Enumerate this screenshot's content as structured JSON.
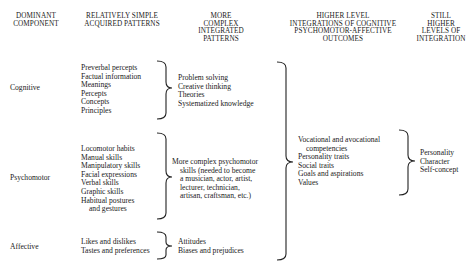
{
  "headers": {
    "col1": [
      "DOMINANT",
      "COMPONENT"
    ],
    "col2": [
      "RELATIVELY SIMPLE",
      "ACQUIRED PATTERNS"
    ],
    "col3": [
      "MORE",
      "COMPLEX",
      "INTEGRATED",
      "PATTERNS"
    ],
    "col4": [
      "HIGHER LEVEL",
      "INTEGRATIONS OF COGNITIVE",
      "PSYCHOMOTOR-AFFECTIVE",
      "OUTCOMES"
    ],
    "col5": [
      "STILL",
      "HIGHER",
      "LEVELS OF",
      "INTEGRATION"
    ]
  },
  "components": {
    "cognitive": {
      "label": "Cognitive",
      "simple": [
        "Preverbal percepts",
        "Factual information",
        "Meanings",
        "Percepts",
        "Concepts",
        "Principles"
      ],
      "complex": [
        "Problem solving",
        "Creative thinking",
        "Theories",
        "Systematized knowledge"
      ]
    },
    "psychomotor": {
      "label": "Psychomotor",
      "simple": [
        "Locomotor habits",
        "Manual skills",
        "Manipulatory skills",
        "Facial expressions",
        "Verbal skills",
        "Graphic skills",
        "Habitual postures",
        "and gestures"
      ],
      "complex": [
        "More complex psychomotor",
        "skills (needed to become",
        "a musician, actor, artist,",
        "lecturer, technician,",
        "artisan, craftsman, etc.)"
      ]
    },
    "affective": {
      "label": "Affective",
      "simple": [
        "Likes and dislikes",
        "Tastes and preferences"
      ],
      "complex": [
        "Attitudes",
        "Biases and prejudices"
      ]
    }
  },
  "higher_level": [
    "Vocational and avocational",
    "competencies",
    "Personality traits",
    "Social traits",
    "Goals and aspirations",
    "Values"
  ],
  "still_higher": [
    "Personality",
    "Character",
    "Self-concept"
  ]
}
